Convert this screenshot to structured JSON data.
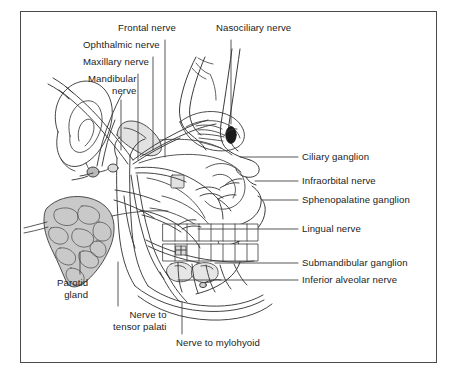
{
  "figure": {
    "frame_color": "#4a4a4a",
    "background": "#ffffff",
    "ink_color": "#3a3a3a",
    "leader_color": "#3a3a3a",
    "gland_fill": "#c9c9c9",
    "bone_fill": "#e2e2e2",
    "pupil_fill": "#1a1a1a"
  },
  "labels": {
    "top": [
      {
        "id": "frontal-nerve",
        "text": "Frontal nerve",
        "x": 118,
        "y": 28,
        "align": "left"
      },
      {
        "id": "ophthalmic-nerve",
        "text": "Ophthalmic nerve",
        "x": 83,
        "y": 45,
        "align": "left"
      },
      {
        "id": "maxillary-nerve",
        "text": "Maxillary nerve",
        "x": 83,
        "y": 62,
        "align": "left"
      },
      {
        "id": "mandibular-nerve",
        "text": "Mandibular\nnerve",
        "x": 88,
        "y": 79,
        "align": "left"
      },
      {
        "id": "nasociliary-nerve",
        "text": "Nasociliary nerve",
        "x": 216,
        "y": 28,
        "align": "left"
      }
    ],
    "right": [
      {
        "id": "ciliary-ganglion",
        "text": "Ciliary ganglion",
        "x": 302,
        "y": 152
      },
      {
        "id": "infraorbital-nerve",
        "text": "Infraorbital nerve",
        "x": 302,
        "y": 176
      },
      {
        "id": "sphenopalatine-ganglion",
        "text": "Sphenopalatine ganglion",
        "x": 302,
        "y": 195
      },
      {
        "id": "lingual-nerve",
        "text": "Lingual nerve",
        "x": 302,
        "y": 224
      },
      {
        "id": "submandibular-ganglion",
        "text": "Submandibular ganglion",
        "x": 302,
        "y": 258
      },
      {
        "id": "inferior-alveolar-nerve",
        "text": "Inferior alveolar nerve",
        "x": 302,
        "y": 275
      }
    ],
    "bottom": [
      {
        "id": "parotid-gland",
        "text": "Parotid\ngland",
        "x": 57,
        "y": 278
      },
      {
        "id": "nerve-to-tensor-palati",
        "text": "Nerve to\ntensor palati",
        "x": 113,
        "y": 310
      },
      {
        "id": "nerve-to-mylohyoid",
        "text": "Nerve to mylohyoid",
        "x": 176,
        "y": 338
      }
    ]
  },
  "structures": [
    {
      "id": "ear-auricle",
      "name": "Ear auricle"
    },
    {
      "id": "parotid-gland-mass",
      "name": "Parotid gland"
    },
    {
      "id": "eye-globe",
      "name": "Eye globe with pupil"
    },
    {
      "id": "upper-teeth-row",
      "name": "Upper teeth row"
    },
    {
      "id": "lower-teeth-row",
      "name": "Lower teeth row"
    },
    {
      "id": "mandible",
      "name": "Mandible"
    },
    {
      "id": "zygomatic-arch",
      "name": "Zygomatic arch"
    },
    {
      "id": "submandibular-gland",
      "name": "Submandibular gland"
    },
    {
      "id": "otic-ganglion-node",
      "name": "Otic ganglion"
    },
    {
      "id": "nasal-profile",
      "name": "Nasal profile"
    }
  ]
}
